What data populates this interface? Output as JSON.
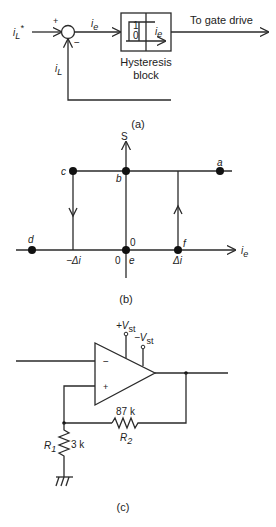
{
  "panel_a": {
    "input_label": "i",
    "input_sub": "L",
    "input_sup": "*",
    "plus_sign": "+",
    "minus_sign": "−",
    "error_label": "i",
    "error_sub": "e",
    "feedback_label": "i",
    "feedback_sub": "L",
    "block_one": "1",
    "block_zero": "0",
    "block_ie": "i",
    "block_ie_sub": "e",
    "block_caption_line1": "Hysteresis",
    "block_caption_line2": "block",
    "output_label": "To gate drive",
    "caption": "(a)"
  },
  "panel_b": {
    "y_axis_label": "S",
    "x_axis_label": "i",
    "x_axis_sub": "e",
    "points": {
      "a": "a",
      "b": "b",
      "c": "c",
      "d": "d",
      "e": "e",
      "f": "f"
    },
    "neg_delta": "−Δi",
    "pos_delta": "Δi",
    "zero_top": "0",
    "zero_left": "0",
    "caption": "(b)"
  },
  "panel_c": {
    "vplus_label": "+V",
    "vplus_sub": "st",
    "vminus_label": "−V",
    "vminus_sub": "st",
    "inv_sign": "−",
    "noninv_sign": "+",
    "r2_value": "87 k",
    "r2_name": "R",
    "r2_sub": "2",
    "r1_name": "R",
    "r1_sub": "1",
    "r1_value": "3 k",
    "caption": "(c)"
  }
}
